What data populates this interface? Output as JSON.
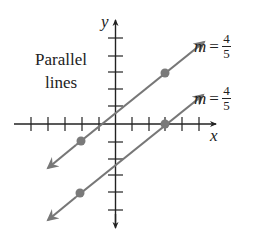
{
  "caption": {
    "line1": "Parallel",
    "line2": "lines"
  },
  "axes": {
    "x_label": "x",
    "y_label": "y"
  },
  "lines": [
    {
      "name": "upper",
      "slope_label": {
        "var": "m",
        "eq": "=",
        "num": "4",
        "den": "5"
      },
      "points": [
        [
          -2,
          -1
        ],
        [
          3,
          3
        ]
      ]
    },
    {
      "name": "lower",
      "slope_label": {
        "var": "m",
        "eq": "=",
        "num": "4",
        "den": "5"
      },
      "points": [
        [
          -2,
          -4
        ],
        [
          3,
          0
        ]
      ]
    }
  ],
  "colors": {
    "line": "#777777",
    "axis": "#222222",
    "point": "#7a7a7a"
  }
}
